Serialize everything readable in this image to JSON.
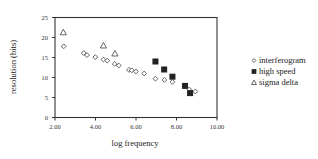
{
  "chart_data": {
    "type": "scatter",
    "title": "",
    "xlabel": "log frequency",
    "ylabel": "resolution (bits)",
    "xlim": [
      2,
      10
    ],
    "ylim": [
      0,
      25
    ],
    "x_ticks": [
      "2.00",
      "4.00",
      "6.00",
      "8.00",
      "10.00"
    ],
    "y_ticks": [
      "0",
      "5",
      "10",
      "15",
      "20",
      "25"
    ],
    "grid": false,
    "legend_position": "right",
    "series": [
      {
        "name": "interferogram",
        "marker": "diamond-open",
        "points": [
          [
            2.43,
            17.8
          ],
          [
            3.42,
            16.1
          ],
          [
            3.58,
            15.6
          ],
          [
            3.99,
            15.1
          ],
          [
            4.39,
            14.5
          ],
          [
            4.58,
            14.2
          ],
          [
            4.95,
            13.4
          ],
          [
            5.15,
            13.0
          ],
          [
            5.65,
            11.9
          ],
          [
            5.79,
            11.8
          ],
          [
            6.0,
            11.5
          ],
          [
            6.4,
            11.0
          ],
          [
            6.96,
            9.7
          ],
          [
            7.4,
            9.4
          ],
          [
            7.8,
            8.9
          ],
          [
            8.63,
            7.0
          ],
          [
            8.93,
            6.5
          ]
        ]
      },
      {
        "name": "high speed",
        "marker": "square-filled",
        "points": [
          [
            6.96,
            14.0
          ],
          [
            7.39,
            12.0
          ],
          [
            7.8,
            10.2
          ],
          [
            8.42,
            7.9
          ],
          [
            8.67,
            6.1
          ]
        ]
      },
      {
        "name": "sigma delta",
        "marker": "triangle-open",
        "points": [
          [
            2.41,
            21.3
          ],
          [
            4.39,
            18.0
          ],
          [
            4.96,
            16.0
          ]
        ]
      }
    ]
  },
  "axes": {
    "x_title": "log frequency",
    "y_title": "resolution (bits)"
  },
  "legend": {
    "items": [
      "interferogram",
      "high speed",
      "sigma delta"
    ]
  }
}
